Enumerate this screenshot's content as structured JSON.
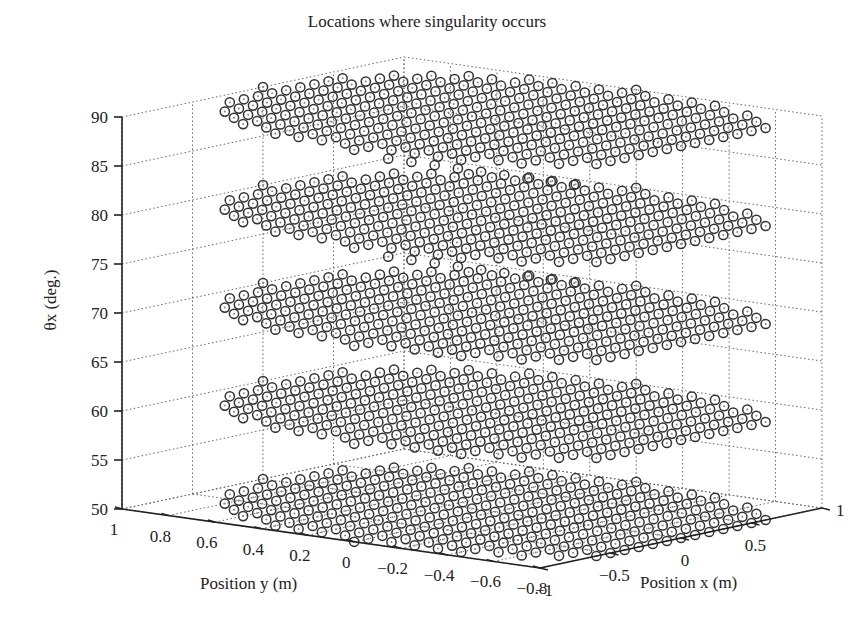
{
  "chart_data": {
    "type": "scatter",
    "dimension": "3d",
    "title": "Locations where singularity occurs",
    "xlabel": "Position x (m)",
    "ylabel": "Position y (m)",
    "zlabel": "θx (deg.)",
    "xlim": [
      -1,
      1
    ],
    "ylim": [
      -0.8,
      1
    ],
    "zlim": [
      50,
      90
    ],
    "x_ticks": [
      "-1",
      "-0.5",
      "0",
      "0.5",
      "1"
    ],
    "x_tick_values": [
      -1,
      -0.5,
      0,
      0.5,
      1
    ],
    "y_ticks": [
      "1",
      "0.8",
      "0.6",
      "0.4",
      "0.2",
      "0",
      "-0.2",
      "-0.4",
      "-0.6",
      "-0.8"
    ],
    "y_tick_values": [
      1,
      0.8,
      0.6,
      0.4,
      0.2,
      0,
      -0.2,
      -0.4,
      -0.6,
      -0.8
    ],
    "z_ticks": [
      "50",
      "55",
      "60",
      "65",
      "70",
      "75",
      "80",
      "85",
      "90"
    ],
    "z_tick_values": [
      50,
      55,
      60,
      65,
      70,
      75,
      80,
      85,
      90
    ],
    "grid": true,
    "marker": "open circle",
    "series": [
      {
        "name": "singularity locations θx=90",
        "z": 90,
        "region": "disk x^2+y^2<=1 sampled on 0.1 m grid"
      },
      {
        "name": "singularity locations θx=80",
        "z": 80,
        "region": "disk x^2+y^2<=1 sampled on 0.1 m grid"
      },
      {
        "name": "singularity locations θx=70",
        "z": 70,
        "region": "disk x^2+y^2<=1 sampled on 0.1 m grid"
      },
      {
        "name": "singularity locations θx=60",
        "z": 60,
        "region": "disk x^2+y^2<=1 sampled on 0.1 m grid"
      },
      {
        "name": "singularity locations θx=50",
        "z": 50,
        "region": "disk x^2+y^2<=1 sampled on 0.1 m grid"
      }
    ],
    "layers_z": [
      90,
      80,
      70,
      60,
      50
    ],
    "grid_step": 0.1,
    "extra_lines_z": [
      85,
      75
    ]
  }
}
